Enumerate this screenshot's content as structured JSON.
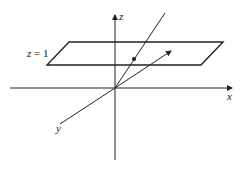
{
  "diagram": {
    "axes": {
      "x_label": "x",
      "y_label": "y",
      "z_label": "z"
    },
    "plane": {
      "label_var": "z",
      "label_eq": " = 1"
    },
    "colors": {
      "stroke": "#222222",
      "background": "#ffffff"
    }
  }
}
